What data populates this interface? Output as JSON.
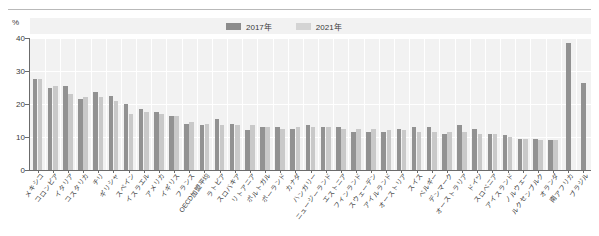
{
  "chart_data": {
    "type": "bar",
    "title": "",
    "subtitle": "",
    "xlabel": "",
    "ylabel": "%",
    "unit": "%",
    "ylim": [
      0,
      40
    ],
    "yticks": [
      0,
      10,
      20,
      30,
      40
    ],
    "grid": true,
    "legend_position": "top-right",
    "orientation": "vertical",
    "grouped": true,
    "categories": [
      "メキシコ",
      "コロンビア",
      "イタリア",
      "コスタリカ",
      "チリ",
      "ギリシャ",
      "スペイン",
      "イスラエル",
      "アメリカ",
      "イギリス",
      "フランス",
      "OECD加盟平均",
      "ラトビア",
      "スロバキア",
      "リトアニア",
      "ポルトガル",
      "ポーランド",
      "カナダ",
      "ハンガリー",
      "ニュージーランド",
      "エストニア",
      "フィンランド",
      "スウェーデン",
      "アイルランド",
      "オーストリア",
      "スイス",
      "ベルギー",
      "デンマーク",
      "オーストラリア",
      "ドイツ",
      "スロベニア",
      "アイスランド",
      "ノルウェー",
      "ルクセンブルク",
      "オランダ",
      "南アフリカ",
      "ブラジル"
    ],
    "series": [
      {
        "name": "2017年",
        "color": "#929292",
        "values": [
          27.5,
          25.0,
          25.5,
          21.5,
          23.5,
          22.5,
          20.0,
          18.5,
          17.5,
          16.5,
          14.0,
          13.5,
          15.5,
          14.0,
          12.0,
          13.0,
          13.0,
          12.5,
          13.5,
          13.0,
          13.0,
          11.5,
          11.5,
          11.5,
          12.5,
          13.0,
          13.0,
          11.0,
          13.5,
          12.5,
          11.0,
          10.5,
          9.5,
          9.5,
          9.0,
          38.5,
          26.5
        ]
      },
      {
        "name": "2021年",
        "color": "#c9c9c9",
        "values": [
          27.5,
          25.5,
          23.0,
          22.0,
          22.0,
          21.0,
          17.0,
          17.5,
          17.0,
          16.5,
          14.5,
          14.0,
          13.5,
          13.5,
          13.5,
          13.0,
          12.5,
          13.0,
          13.0,
          13.0,
          12.5,
          12.5,
          12.5,
          12.0,
          12.0,
          11.5,
          11.5,
          11.5,
          11.5,
          11.0,
          11.0,
          10.0,
          9.5,
          9.0,
          9.0,
          null,
          null
        ]
      }
    ]
  },
  "legend": {
    "items": [
      {
        "label": "2017年",
        "color": "#929292"
      },
      {
        "label": "2021年",
        "color": "#c9c9c9"
      }
    ]
  },
  "axes": {
    "y_unit_label": "%",
    "y_tick_labels": [
      "40",
      "30",
      "20",
      "10",
      "0"
    ]
  },
  "colors": {
    "plot_background": "#f2f2f2",
    "axis": "#6b6b6b",
    "gridline": "#ffffff",
    "series_2017": "#929292",
    "series_2021": "#c9c9c9",
    "text": "#3a3a3a"
  }
}
